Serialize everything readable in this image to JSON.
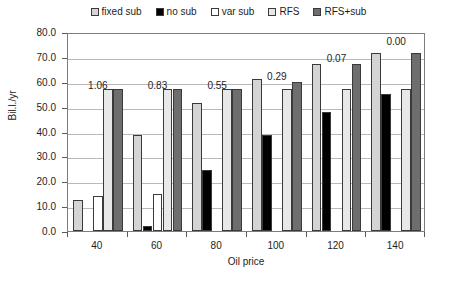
{
  "chart_data": {
    "type": "bar",
    "title": "",
    "xlabel": "Oil price",
    "ylabel": "Bil.l./yr",
    "categories": [
      "40",
      "60",
      "80",
      "100",
      "120",
      "140"
    ],
    "ylim": [
      0,
      80
    ],
    "ytick_step": 10,
    "yticks": [
      "0.0",
      "10.0",
      "20.0",
      "30.0",
      "40.0",
      "50.0",
      "60.0",
      "70.0",
      "80.0"
    ],
    "grid": true,
    "legend_position": "top",
    "series": [
      {
        "name": "fixed sub",
        "color": "#d4d4d4",
        "values": [
          12.5,
          38.5,
          51.5,
          61.0,
          67.0,
          71.5
        ]
      },
      {
        "name": "no sub",
        "color": "#000000",
        "values": [
          0.0,
          2.0,
          24.5,
          38.5,
          48.0,
          55.0
        ]
      },
      {
        "name": "var sub",
        "color": "#ffffff",
        "values": [
          14.0,
          15.0,
          0.0,
          0.0,
          0.0,
          0.0
        ]
      },
      {
        "name": "RFS",
        "color": "#e8e8e8",
        "values": [
          57.0,
          57.0,
          57.0,
          57.0,
          57.0,
          57.0
        ]
      },
      {
        "name": "RFS+sub",
        "color": "#6e6e6e",
        "values": [
          57.0,
          57.0,
          57.0,
          60.0,
          67.0,
          71.5
        ]
      }
    ],
    "annotations": [
      {
        "category": "40",
        "text": "1.06",
        "y": 58.5
      },
      {
        "category": "60",
        "text": "0.83",
        "y": 58.5
      },
      {
        "category": "80",
        "text": "0.55",
        "y": 58.5
      },
      {
        "category": "100",
        "text": "0.29",
        "y": 62.5
      },
      {
        "category": "120",
        "text": "0.07",
        "y": 69.5
      },
      {
        "category": "140",
        "text": "0.00",
        "y": 76.5
      }
    ]
  },
  "legend": {
    "items": [
      {
        "label": "fixed sub"
      },
      {
        "label": "no sub"
      },
      {
        "label": "var sub"
      },
      {
        "label": "RFS"
      },
      {
        "label": "RFS+sub"
      }
    ]
  }
}
